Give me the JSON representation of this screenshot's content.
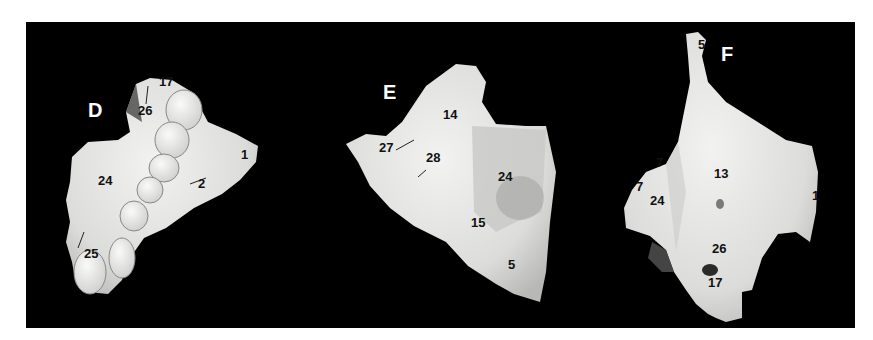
{
  "figure": {
    "background_color": "#000000",
    "bone_color": "#e6e6e4",
    "panels": [
      {
        "letter": "D",
        "labels": [
          "17",
          "26",
          "1",
          "24",
          "2",
          "25"
        ]
      },
      {
        "letter": "E",
        "labels": [
          "14",
          "27",
          "28",
          "24",
          "15",
          "5"
        ]
      },
      {
        "letter": "F",
        "labels": [
          "5",
          "7",
          "7",
          "13",
          "24",
          "1",
          "26",
          "17"
        ]
      }
    ]
  }
}
